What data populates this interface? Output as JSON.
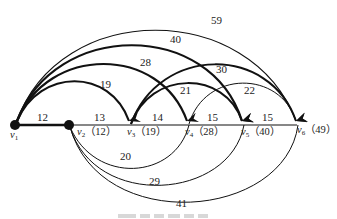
{
  "diagram": {
    "type": "weighted-directed-graph",
    "nodes": [
      {
        "id": "v1",
        "name": "v",
        "sub": "1",
        "value": ""
      },
      {
        "id": "v2",
        "name": "v",
        "sub": "2",
        "value": "（12）"
      },
      {
        "id": "v3",
        "name": "v",
        "sub": "3",
        "value": "（19）"
      },
      {
        "id": "v4",
        "name": "v",
        "sub": "4",
        "value": "（28）"
      },
      {
        "id": "v5",
        "name": "v",
        "sub": "5",
        "value": "（40）"
      },
      {
        "id": "v6",
        "name": "v",
        "sub": "6",
        "value": "（49）"
      }
    ],
    "edges": {
      "baseline": [
        {
          "from": "v1",
          "to": "v2",
          "weight": "12"
        },
        {
          "from": "v2",
          "to": "v3",
          "weight": "13"
        },
        {
          "from": "v3",
          "to": "v4",
          "weight": "14"
        },
        {
          "from": "v4",
          "to": "v5",
          "weight": "15"
        },
        {
          "from": "v5",
          "to": "v6",
          "weight": "15"
        }
      ],
      "upper_arcs": [
        {
          "from": "v1",
          "to": "v3",
          "weight": "19",
          "style": "bold"
        },
        {
          "from": "v1",
          "to": "v4",
          "weight": "28",
          "style": "bold"
        },
        {
          "from": "v1",
          "to": "v5",
          "weight": "40",
          "style": "bold"
        },
        {
          "from": "v1",
          "to": "v6",
          "weight": "59",
          "style": "thin"
        },
        {
          "from": "v3",
          "to": "v5",
          "weight": "21",
          "style": "bold"
        },
        {
          "from": "v3",
          "to": "v6",
          "weight": "30",
          "style": "bold"
        },
        {
          "from": "v4",
          "to": "v6",
          "weight": "22",
          "style": "thin"
        }
      ],
      "lower_arcs": [
        {
          "from": "v2",
          "to": "v4",
          "weight": "20",
          "style": "thin"
        },
        {
          "from": "v2",
          "to": "v5",
          "weight": "29",
          "style": "thin"
        },
        {
          "from": "v2",
          "to": "v6",
          "weight": "41",
          "style": "thin"
        }
      ]
    }
  }
}
